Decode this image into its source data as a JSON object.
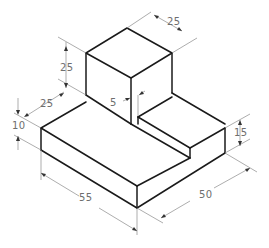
{
  "figure": {
    "type": "isometric-technical-drawing",
    "colors": {
      "edge": "#1a1a1a",
      "dimension_line": "#8a8a8a",
      "dimension_text": "#6e6e6e",
      "background": "#ffffff"
    }
  },
  "dimensions": {
    "cube_depth_top": "25",
    "cube_height": "25",
    "cube_width_left": "25",
    "step_offset": "5",
    "base_height": "10",
    "step_height": "15",
    "base_length": "55",
    "base_width": "50"
  }
}
